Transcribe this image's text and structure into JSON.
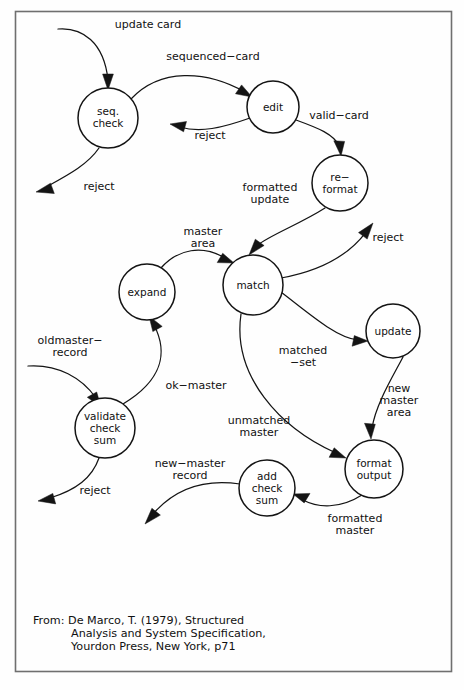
{
  "diagram": {
    "type": "data-flow-diagram",
    "frame": {
      "stroke_color": "#6f6f6f"
    },
    "ink_color": "#141414",
    "background_color": "#ffffff",
    "processes": [
      {
        "id": "seq-check",
        "label_lines": [
          "seq.",
          "check"
        ],
        "cx": 108,
        "cy": 118,
        "r": 30
      },
      {
        "id": "edit",
        "label_lines": [
          "edit"
        ],
        "cx": 273,
        "cy": 107,
        "r": 26
      },
      {
        "id": "re-format",
        "label_lines": [
          "re−",
          "format"
        ],
        "cx": 340,
        "cy": 183,
        "r": 28
      },
      {
        "id": "match",
        "label_lines": [
          "match"
        ],
        "cx": 253,
        "cy": 285,
        "r": 30
      },
      {
        "id": "expand",
        "label_lines": [
          "expand"
        ],
        "cx": 147,
        "cy": 292,
        "r": 28
      },
      {
        "id": "validate-check-sum",
        "label_lines": [
          "validate",
          "check",
          "sum"
        ],
        "cx": 105,
        "cy": 428,
        "r": 30
      },
      {
        "id": "update",
        "label_lines": [
          "update"
        ],
        "cx": 393,
        "cy": 331,
        "r": 27
      },
      {
        "id": "format-output",
        "label_lines": [
          "format",
          "output"
        ],
        "cx": 374,
        "cy": 469,
        "r": 29
      },
      {
        "id": "add-check-sum",
        "label_lines": [
          "add",
          "check",
          "sum"
        ],
        "cx": 267,
        "cy": 488,
        "r": 28
      }
    ],
    "flows": [
      {
        "id": "update-card",
        "label_lines": [
          "update card"
        ],
        "label_x": 148,
        "label_y": 28,
        "from": "external",
        "to": "seq-check"
      },
      {
        "id": "sequenced-card",
        "label_lines": [
          "sequenced−card"
        ],
        "label_x": 213,
        "label_y": 60,
        "from": "seq-check",
        "to": "edit"
      },
      {
        "id": "reject-edit",
        "label_lines": [
          "reject"
        ],
        "label_x": 210,
        "label_y": 139,
        "from": "edit",
        "to": "external"
      },
      {
        "id": "reject-seq-check",
        "label_lines": [
          "reject"
        ],
        "label_x": 99,
        "label_y": 190,
        "from": "seq-check",
        "to": "external"
      },
      {
        "id": "valid-card",
        "label_lines": [
          "valid−card"
        ],
        "label_x": 339,
        "label_y": 119,
        "from": "edit",
        "to": "re-format"
      },
      {
        "id": "formatted-update",
        "label_lines": [
          "formatted",
          "update"
        ],
        "label_x": 270,
        "label_y": 191,
        "from": "re-format",
        "to": "match"
      },
      {
        "id": "reject-match",
        "label_lines": [
          "reject"
        ],
        "label_x": 388,
        "label_y": 241,
        "from": "match",
        "to": "external"
      },
      {
        "id": "master-area",
        "label_lines": [
          "master",
          "area"
        ],
        "label_x": 203,
        "label_y": 235,
        "from": "expand",
        "to": "match"
      },
      {
        "id": "oldmaster-record",
        "label_lines": [
          "oldmaster−",
          "record"
        ],
        "label_x": 70,
        "label_y": 344,
        "from": "external",
        "to": "validate-check-sum"
      },
      {
        "id": "ok-master",
        "label_lines": [
          "ok−master"
        ],
        "label_x": 196,
        "label_y": 389,
        "from": "validate-check-sum",
        "to": "expand"
      },
      {
        "id": "matched-set",
        "label_lines": [
          "matched",
          "−set"
        ],
        "label_x": 303,
        "label_y": 354,
        "from": "match",
        "to": "update"
      },
      {
        "id": "new-master-area",
        "label_lines": [
          "new",
          "master",
          "area"
        ],
        "label_x": 399,
        "label_y": 392,
        "from": "update",
        "to": "format-output"
      },
      {
        "id": "unmatched-master",
        "label_lines": [
          "unmatched",
          "master"
        ],
        "label_x": 259,
        "label_y": 424,
        "from": "match",
        "to": "format-output"
      },
      {
        "id": "reject-validate",
        "label_lines": [
          "reject"
        ],
        "label_x": 95,
        "label_y": 494,
        "from": "validate-check-sum",
        "to": "external"
      },
      {
        "id": "new-master-record",
        "label_lines": [
          "new−master",
          "record"
        ],
        "label_x": 190,
        "label_y": 467,
        "from": "add-check-sum",
        "to": "external"
      },
      {
        "id": "formatted-master",
        "label_lines": [
          "formatted",
          "master"
        ],
        "label_x": 355,
        "label_y": 522,
        "from": "format-output",
        "to": "add-check-sum"
      }
    ],
    "caption": {
      "lines": [
        "From: De Marco, T. (1979), Structured",
        "Analysis and System Specification,",
        "Yourdon Press, New York, p71"
      ]
    }
  }
}
